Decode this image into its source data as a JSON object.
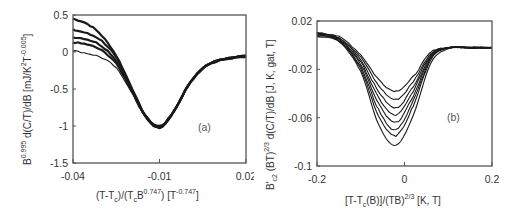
{
  "chart_data": [
    {
      "panel": "a",
      "type": "line",
      "panel_label": "(a)",
      "title": "",
      "xlabel": "(T-Tc)/(TcB^0.747)  [T^-0.747]",
      "xlabel_parts": {
        "main": "(T-T",
        "sub1": "c",
        "mid": ")/(T",
        "sub2": "c",
        "mid2": "B",
        "sup": "0.747",
        "tail": ")  [T",
        "unit_sup": "-0.747",
        "end": "]"
      },
      "ylabel": "B^0.995 d(C/T)/dB  [mJ/K^2T^-0.005]",
      "ylabel_parts": {
        "pre": "B",
        "sup1": "0.995",
        "mid": " d(C/T)/dB  [mJ/K",
        "sup2": "2",
        "mid2": "T",
        "sup3": "-0.005",
        "end": "]"
      },
      "xlim": [
        -0.04,
        0.02
      ],
      "ylim": [
        -1.5,
        0.5
      ],
      "xticks": [
        -0.04,
        -0.01,
        0.02
      ],
      "xtick_labels": [
        "-0.04",
        "-0.01",
        "0.02"
      ],
      "yticks": [
        0.5,
        0,
        -0.5,
        -1,
        -1.5
      ],
      "ytick_labels": [
        "0.5",
        "0",
        "-0.5",
        "-1",
        "-1.5"
      ],
      "grid": false,
      "legend": null,
      "description": "Many overlapping noisy curves collapse onto a single dip with minimum ~-1.0 at x~-0.01; curves spread at left edge (0 to 0.45), converge to ~-0.1 at right.",
      "series": [
        {
          "name": "curve-1",
          "x": [
            -0.04,
            -0.035,
            -0.03,
            -0.025,
            -0.02,
            -0.015,
            -0.01,
            -0.005,
            0.0,
            0.005,
            0.01,
            0.015,
            0.02
          ],
          "y": [
            0.45,
            0.38,
            0.22,
            -0.05,
            -0.45,
            -0.85,
            -1.0,
            -0.8,
            -0.45,
            -0.22,
            -0.12,
            -0.07,
            -0.05
          ]
        },
        {
          "name": "curve-2",
          "x": [
            -0.04,
            -0.035,
            -0.03,
            -0.025,
            -0.02,
            -0.015,
            -0.01,
            -0.005,
            0.0,
            0.005,
            0.01,
            0.015,
            0.02
          ],
          "y": [
            0.3,
            0.25,
            0.15,
            -0.08,
            -0.47,
            -0.86,
            -1.02,
            -0.8,
            -0.45,
            -0.22,
            -0.12,
            -0.08,
            -0.06
          ]
        },
        {
          "name": "curve-3",
          "x": [
            -0.04,
            -0.035,
            -0.03,
            -0.025,
            -0.02,
            -0.015,
            -0.01,
            -0.005,
            0.0,
            0.005,
            0.01,
            0.015,
            0.02
          ],
          "y": [
            0.2,
            0.17,
            0.08,
            -0.12,
            -0.48,
            -0.86,
            -1.02,
            -0.8,
            -0.45,
            -0.22,
            -0.12,
            -0.08,
            -0.06
          ]
        },
        {
          "name": "curve-4",
          "x": [
            -0.04,
            -0.035,
            -0.03,
            -0.025,
            -0.02,
            -0.015,
            -0.01,
            -0.005,
            0.0,
            0.005,
            0.01,
            0.015,
            0.02
          ],
          "y": [
            0.13,
            0.1,
            0.02,
            -0.16,
            -0.5,
            -0.86,
            -1.02,
            -0.8,
            -0.45,
            -0.22,
            -0.12,
            -0.08,
            -0.06
          ]
        },
        {
          "name": "curve-5",
          "x": [
            -0.04,
            -0.035,
            -0.03,
            -0.025,
            -0.02,
            -0.015,
            -0.01,
            -0.005,
            0.0,
            0.005,
            0.01,
            0.015,
            0.02
          ],
          "y": [
            0.02,
            -0.02,
            -0.08,
            -0.22,
            -0.52,
            -0.87,
            -1.02,
            -0.8,
            -0.45,
            -0.22,
            -0.12,
            -0.08,
            -0.06
          ]
        }
      ]
    },
    {
      "panel": "b",
      "type": "line",
      "panel_label": "(b)",
      "title": "",
      "xlabel": "[T-Tc(B)]/(TB)^2/3  [K, T]",
      "xlabel_parts": {
        "main": "[T-T",
        "sub": "c",
        "mid": "(B)]/(TB)",
        "sup": "2/3",
        "end": "  [K, T]"
      },
      "ylabel": "B'c2 (BT)^2/3 d(C/T)/dB  [J, K, gat, T]",
      "ylabel_parts": {
        "pre": "B'",
        "sub1": "c2",
        "mid": " (BT)",
        "sup1": "2/3",
        "end": " d(C/T)/dB  [J, K, gat, T]"
      },
      "xlim": [
        -0.2,
        0.2
      ],
      "ylim": [
        -0.1,
        0.02
      ],
      "xticks": [
        -0.2,
        0,
        0.2
      ],
      "xtick_labels": [
        "-0.2",
        "0",
        "0.2"
      ],
      "yticks": [
        0.02,
        -0.02,
        -0.06,
        -0.1
      ],
      "ytick_labels": [
        "0.02",
        "-0.02",
        "-0.06",
        "-0.1"
      ],
      "grid": false,
      "legend": null,
      "description": "Family of nested dip curves centred at x~-0.02; minima fan from ~-0.038 (shallowest) down to ~-0.083 (deepest); all converge to ~0.01 at left and ~-0.002 at right.",
      "series": [
        {
          "name": "curve-1",
          "x": [
            -0.2,
            -0.15,
            -0.1,
            -0.06,
            -0.02,
            0.02,
            0.06,
            0.1,
            0.15,
            0.2
          ],
          "y": [
            0.01,
            0.007,
            -0.008,
            -0.028,
            -0.038,
            -0.026,
            -0.006,
            -0.002,
            -0.002,
            -0.002
          ]
        },
        {
          "name": "curve-2",
          "x": [
            -0.2,
            -0.15,
            -0.1,
            -0.06,
            -0.02,
            0.02,
            0.06,
            0.1,
            0.15,
            0.2
          ],
          "y": [
            0.01,
            0.006,
            -0.01,
            -0.033,
            -0.045,
            -0.03,
            -0.007,
            -0.002,
            -0.002,
            -0.002
          ]
        },
        {
          "name": "curve-3",
          "x": [
            -0.2,
            -0.15,
            -0.1,
            -0.06,
            -0.02,
            0.02,
            0.06,
            0.1,
            0.15,
            0.2
          ],
          "y": [
            0.01,
            0.006,
            -0.012,
            -0.038,
            -0.052,
            -0.034,
            -0.008,
            -0.002,
            -0.002,
            -0.002
          ]
        },
        {
          "name": "curve-4",
          "x": [
            -0.2,
            -0.15,
            -0.1,
            -0.06,
            -0.02,
            0.02,
            0.06,
            0.1,
            0.15,
            0.2
          ],
          "y": [
            0.009,
            0.005,
            -0.014,
            -0.043,
            -0.058,
            -0.038,
            -0.009,
            -0.002,
            -0.002,
            -0.002
          ]
        },
        {
          "name": "curve-5",
          "x": [
            -0.2,
            -0.15,
            -0.1,
            -0.06,
            -0.02,
            0.02,
            0.06,
            0.1,
            0.15,
            0.2
          ],
          "y": [
            0.009,
            0.005,
            -0.016,
            -0.048,
            -0.064,
            -0.042,
            -0.01,
            -0.002,
            -0.002,
            -0.002
          ]
        },
        {
          "name": "curve-6",
          "x": [
            -0.2,
            -0.15,
            -0.1,
            -0.06,
            -0.02,
            0.02,
            0.06,
            0.1,
            0.15,
            0.2
          ],
          "y": [
            0.008,
            0.004,
            -0.018,
            -0.053,
            -0.07,
            -0.046,
            -0.011,
            -0.002,
            -0.002,
            -0.002
          ]
        },
        {
          "name": "curve-7",
          "x": [
            -0.2,
            -0.15,
            -0.1,
            -0.06,
            -0.02,
            0.02,
            0.06,
            0.1,
            0.15,
            0.2
          ],
          "y": [
            0.008,
            0.004,
            -0.02,
            -0.058,
            -0.075,
            -0.05,
            -0.012,
            -0.002,
            -0.002,
            -0.002
          ]
        },
        {
          "name": "curve-8",
          "x": [
            -0.2,
            -0.15,
            -0.1,
            -0.06,
            -0.02,
            0.02,
            0.06,
            0.1,
            0.15,
            0.2
          ],
          "y": [
            0.007,
            0.003,
            -0.022,
            -0.065,
            -0.083,
            -0.058,
            -0.015,
            -0.003,
            -0.002,
            -0.002
          ]
        }
      ]
    }
  ]
}
